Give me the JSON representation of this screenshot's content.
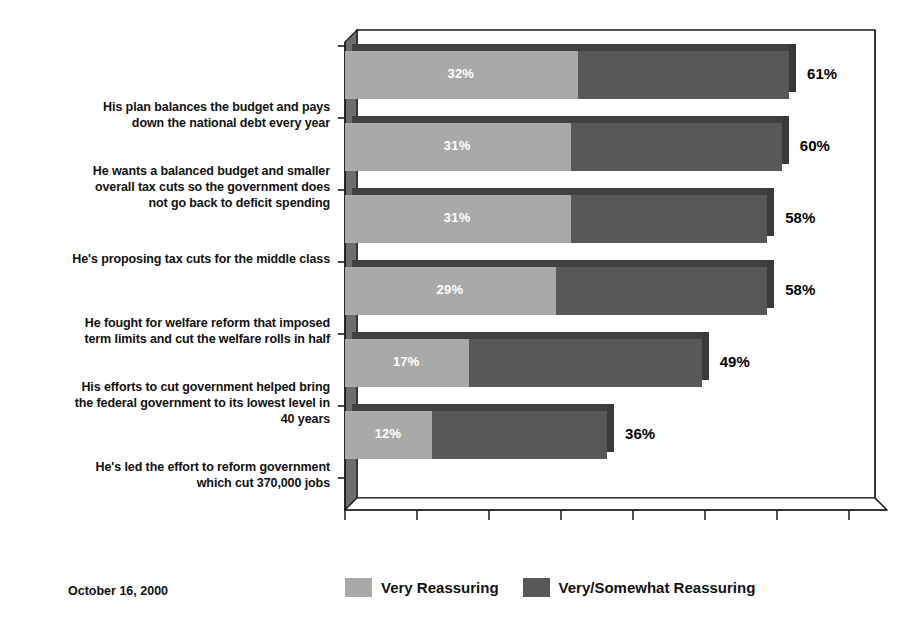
{
  "chart_data": {
    "type": "bar",
    "orientation": "horizontal",
    "stacked": true,
    "title": "",
    "subtitle": "",
    "xlabel": "",
    "ylabel": "",
    "xlim": [
      0,
      80
    ],
    "grid": false,
    "axis_tick_labels": [],
    "axis_tick_count": 8,
    "legend_position": "bottom",
    "categories": [
      "His plan balances the budget and pays down the national debt every year",
      "He wants a balanced budget and smaller overall tax cuts so the government does not go back to deficit spending",
      "He's proposing tax cuts for the middle class",
      "He fought for welfare reform that imposed term limits and cut the welfare rolls in half",
      "His efforts to cut government helped bring the federal government to its lowest level in 40 years",
      "He's led the effort to reform government which cut 370,000 jobs"
    ],
    "series": [
      {
        "name": "Very Reassuring",
        "color": "#a9a9a9",
        "values": [
          32,
          31,
          31,
          29,
          17,
          12
        ],
        "labels": [
          "32%",
          "31%",
          "31%",
          "29%",
          "17%",
          "12%"
        ]
      },
      {
        "name": "Very/Somewhat Reassuring",
        "color": "#585858",
        "values": [
          61,
          60,
          58,
          58,
          49,
          36
        ],
        "labels": [
          "61%",
          "60%",
          "58%",
          "58%",
          "49%",
          "36%"
        ]
      }
    ],
    "note": "Dark segment extends from the light segment's end to the total value; totals are the outer labels."
  },
  "rows": [
    {
      "label_lines": [
        "His plan balances the budget and pays",
        "down the national debt every year"
      ],
      "inner_label": "32%",
      "inner_value": 32,
      "total_label": "61%",
      "total_value": 61
    },
    {
      "label_lines": [
        "He wants a balanced budget and smaller",
        "overall tax cuts so the government does",
        "not go back to deficit spending"
      ],
      "inner_label": "31%",
      "inner_value": 31,
      "total_label": "60%",
      "total_value": 60
    },
    {
      "label_lines": [
        "He's proposing tax cuts for the middle class"
      ],
      "inner_label": "31%",
      "inner_value": 31,
      "total_label": "58%",
      "total_value": 58
    },
    {
      "label_lines": [
        "He fought for welfare reform that imposed",
        "term limits and cut the welfare rolls in half"
      ],
      "inner_label": "29%",
      "inner_value": 29,
      "total_label": "58%",
      "total_value": 58
    },
    {
      "label_lines": [
        "His efforts to cut government helped bring",
        "the federal government to its lowest level in",
        "40 years"
      ],
      "inner_label": "17%",
      "inner_value": 17,
      "total_label": "49%",
      "total_value": 49
    },
    {
      "label_lines": [
        "He's led the effort to reform government",
        "which cut 370,000 jobs"
      ],
      "inner_label": "12%",
      "inner_value": 12,
      "total_label": "36%",
      "total_value": 36
    }
  ],
  "legend": {
    "items": [
      {
        "label": "Very Reassuring",
        "color": "#a9a9a9",
        "swatch": "light"
      },
      {
        "label": "Very/Somewhat Reassuring",
        "color": "#585858",
        "swatch": "dark"
      }
    ]
  },
  "footer": {
    "date": "October 16, 2000"
  },
  "colors": {
    "series_light": "#a9a9a9",
    "series_dark": "#585858",
    "bar_shadow": "#3f3f3f",
    "frame": "#1a1a1a",
    "text": "#111111",
    "background": "#ffffff"
  }
}
